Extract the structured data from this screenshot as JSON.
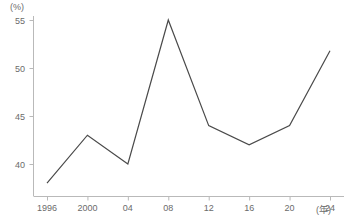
{
  "chart_data": {
    "type": "line",
    "title": "",
    "xlabel": "(年)",
    "ylabel": "(%)",
    "x": [
      "1996",
      "2000",
      "04",
      "08",
      "12",
      "16",
      "20",
      "24"
    ],
    "x_values": [
      1996,
      2000,
      2004,
      2008,
      2012,
      2016,
      2020,
      2024
    ],
    "categories": [
      "1996",
      "2000",
      "04",
      "08",
      "12",
      "16",
      "20",
      "24"
    ],
    "values": [
      38.0,
      43.0,
      40.0,
      55.0,
      44.0,
      42.0,
      44.0,
      51.8
    ],
    "series": [
      {
        "name": "",
        "values": [
          38.0,
          43.0,
          40.0,
          55.0,
          44.0,
          42.0,
          44.0,
          51.8
        ]
      }
    ],
    "ylim": [
      36.5,
      55.6
    ],
    "xlim": [
      1995.2,
      2024.8
    ],
    "yticks": [
      40,
      45,
      50,
      55
    ],
    "ytick_labels": [
      "40",
      "45",
      "50",
      "55"
    ],
    "xtick_labels": [
      "1996",
      "2000",
      "04",
      "08",
      "12",
      "16",
      "20",
      "24"
    ],
    "grid": false,
    "legend": false,
    "legend_position": "none",
    "line_color": "#4a4a4a",
    "axis_color": "#b9b9b9",
    "tick_label_color": "#6b6b6b",
    "background_color": "#ffffff"
  },
  "axes": {
    "y_unit": "(%)",
    "x_unit": "(年)"
  }
}
